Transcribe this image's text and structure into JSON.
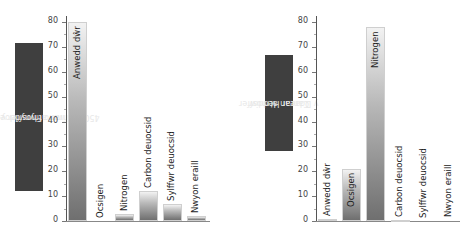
{
  "chart_data": [
    {
      "type": "bar",
      "title": "",
      "ylabel": "Canran atmosffer y Ddaear 4500 Miliwn o Flynyddoedd yn ôl",
      "xlabel": "",
      "ylim": [
        0,
        80
      ],
      "yticks": [
        0,
        10,
        20,
        30,
        40,
        50,
        60,
        70,
        80
      ],
      "categories": [
        "Anwedd dŵr",
        "Ocsigen",
        "Nitrogen",
        "Carbon deuocsid",
        "Sylffwr deuocsid",
        "Nwyon eraill"
      ],
      "values": [
        80,
        0,
        3,
        12,
        7,
        2
      ],
      "grid": false,
      "legend": null
    },
    {
      "type": "bar",
      "title": "",
      "ylabel": "Canran atmosffer y Ddaear Heddiw",
      "xlabel": "",
      "ylim": [
        0,
        80
      ],
      "yticks": [
        0,
        10,
        20,
        30,
        40,
        50,
        60,
        70,
        80
      ],
      "categories": [
        "Anwedd dŵr",
        "Ocsigen",
        "Nitrogen",
        "Carbon deuocsid",
        "Sylffwr deuocsid",
        "Nwyon eraill"
      ],
      "values": [
        1,
        21,
        78,
        0.5,
        0.2,
        0.3
      ],
      "grid": false,
      "legend": null
    }
  ],
  "left": {
    "ylabel_line1": "Canran atmosffer y Ddaear",
    "ylabel_line2": "4500 Miliwn o Flynyddoedd yn ôl"
  },
  "right": {
    "ylabel_line1": "Canran atmosffer",
    "ylabel_line2": "y Ddaear Heddiw"
  },
  "colors": {
    "label_box": "#3f3f3f",
    "bar_top": "#f2f2f2",
    "bar_bottom": "#6f6f6f"
  }
}
